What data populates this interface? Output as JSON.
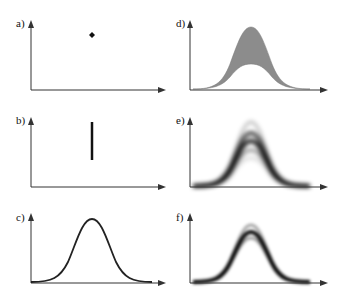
{
  "figure": {
    "panels": [
      {
        "id": "a",
        "label": "a)",
        "description": "single point",
        "glyph": "diamond-dot"
      },
      {
        "id": "b",
        "label": "b)",
        "description": "vertical line segment (interval)"
      },
      {
        "id": "c",
        "label": "c)",
        "description": "bell-shaped curve (single line)"
      },
      {
        "id": "d",
        "label": "d)",
        "description": "gray-filled band between two bell curves"
      },
      {
        "id": "e",
        "label": "e)",
        "description": "blurred density band of bell curves, wide spread"
      },
      {
        "id": "f",
        "label": "f)",
        "description": "blurred density band of bell curves, narrower spread"
      }
    ],
    "colors": {
      "axis": "#333333",
      "curve": "#222222",
      "band_fill": "#8c8c8c",
      "density": "#000000"
    }
  }
}
